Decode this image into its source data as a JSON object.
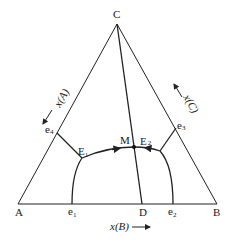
{
  "diagram": {
    "type": "ternary-phase-diagram",
    "vertices": {
      "A": {
        "label": "A"
      },
      "B": {
        "label": "B"
      },
      "C": {
        "label": "C"
      },
      "D": {
        "label": "D"
      }
    },
    "points": {
      "M": {
        "label": "M"
      },
      "E1": {
        "label": "E",
        "sub": "1"
      },
      "E2": {
        "label": "E",
        "sub": "2"
      },
      "e1": {
        "label": "e",
        "sub": "1"
      },
      "e2": {
        "label": "e",
        "sub": "2"
      },
      "e3": {
        "label": "e",
        "sub": "3"
      },
      "e4": {
        "label": "e",
        "sub": "4"
      }
    },
    "axes": {
      "bottom": "x(B)",
      "left": "x(A)",
      "right": "x(C)"
    },
    "colors": {
      "line": "#222222",
      "background": "#ffffff"
    }
  }
}
